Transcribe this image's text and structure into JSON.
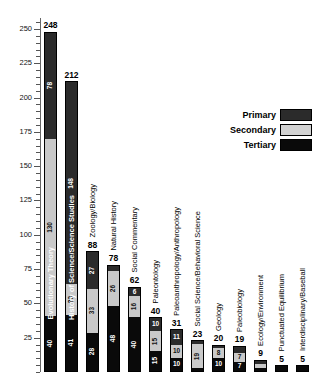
{
  "chart_data": {
    "type": "bar",
    "subtype": "stacked-vertical",
    "title": "",
    "xlabel": "",
    "ylabel": "",
    "ylim": [
      0,
      258
    ],
    "y_major_ticks": [
      25,
      50,
      75,
      100,
      125,
      150,
      175,
      200,
      225,
      250
    ],
    "y_tick_labels": [
      "25",
      "50",
      "75",
      "100",
      "125",
      "150",
      "175",
      "200",
      "225",
      "250"
    ],
    "y_minor_tick_step": 5,
    "grid": false,
    "legend_position": "upper-right",
    "categories": [
      "Evolutionary Theory",
      "History of Science/Science Studies",
      "Zoology/Biology",
      "Natural History",
      "Social Commentary",
      "Paleontology",
      "Paleoanthropology/Anthropology",
      "Social Science/Behavioral Science",
      "Geology",
      "Paleobiology",
      "Ecology/Environment",
      "Punctuated Equilibrium",
      "Interdisciplinary/Baseball"
    ],
    "series": [
      {
        "name": "Primary",
        "color": "#2b2b2b",
        "values": [
          78,
          148,
          27,
          4,
          6,
          10,
          11,
          2,
          2,
          5,
          3,
          0,
          0
        ]
      },
      {
        "name": "Secondary",
        "color": "#d2d2d2",
        "values": [
          130,
          23,
          33,
          26,
          16,
          15,
          10,
          19,
          8,
          7,
          3,
          0,
          0
        ]
      },
      {
        "name": "Tertiary",
        "color": "#0a0a0a",
        "values": [
          40,
          41,
          28,
          48,
          40,
          15,
          10,
          2,
          10,
          7,
          3,
          5,
          5
        ]
      }
    ],
    "totals": [
      248,
      212,
      88,
      78,
      62,
      40,
      31,
      23,
      20,
      19,
      9,
      5,
      5
    ]
  },
  "legend": {
    "title": "",
    "entries": [
      {
        "label": "Primary",
        "color": "#2b2b2b"
      },
      {
        "label": "Secondary",
        "color": "#d2d2d2"
      },
      {
        "label": "Tertiary",
        "color": "#0a0a0a"
      }
    ]
  },
  "bars": [
    {
      "category": "Evolutionary Theory",
      "total": "248",
      "label_placement": "inside",
      "segments": [
        {
          "tier": "primary",
          "value": "78",
          "class": "seg-tertiary"
        },
        {
          "tier": "secondary",
          "value": "130",
          "class": "seg-secondary"
        },
        {
          "tier": "tertiary",
          "value": "40",
          "class": "seg-primary"
        }
      ]
    },
    {
      "category": "History of Science/Science Studies",
      "total": "212",
      "label_placement": "inside",
      "segments": [
        {
          "tier": "primary",
          "value": "148",
          "class": "seg-tertiary"
        },
        {
          "tier": "secondary",
          "value": "23",
          "class": "seg-secondary"
        },
        {
          "tier": "tertiary",
          "value": "41",
          "class": "seg-primary"
        }
      ]
    },
    {
      "category": "Zoology/Biology",
      "total": "88",
      "label_placement": "outside",
      "segments": [
        {
          "tier": "primary",
          "value": "27",
          "class": "seg-tertiary"
        },
        {
          "tier": "secondary",
          "value": "33",
          "class": "seg-secondary"
        },
        {
          "tier": "tertiary",
          "value": "28",
          "class": "seg-primary"
        }
      ]
    },
    {
      "category": "Natural History",
      "total": "78",
      "label_placement": "outside",
      "segments": [
        {
          "tier": "primary",
          "value": "4",
          "class": "seg-tertiary"
        },
        {
          "tier": "secondary",
          "value": "26",
          "class": "seg-secondary"
        },
        {
          "tier": "tertiary",
          "value": "48",
          "class": "seg-primary"
        }
      ]
    },
    {
      "category": "Social Commentary",
      "total": "62",
      "label_placement": "outside",
      "segments": [
        {
          "tier": "primary",
          "value": "6",
          "class": "seg-tertiary"
        },
        {
          "tier": "secondary",
          "value": "16",
          "class": "seg-secondary"
        },
        {
          "tier": "tertiary",
          "value": "40",
          "class": "seg-primary"
        }
      ]
    },
    {
      "category": "Paleontology",
      "total": "40",
      "label_placement": "outside",
      "segments": [
        {
          "tier": "primary",
          "value": "10",
          "class": "seg-tertiary"
        },
        {
          "tier": "secondary",
          "value": "15",
          "class": "seg-secondary"
        },
        {
          "tier": "tertiary",
          "value": "15",
          "class": "seg-primary"
        }
      ]
    },
    {
      "category": "Paleoanthropology/Anthropology",
      "total": "31",
      "label_placement": "outside",
      "segments": [
        {
          "tier": "primary",
          "value": "11",
          "class": "seg-tertiary"
        },
        {
          "tier": "secondary",
          "value": "10",
          "class": "seg-secondary"
        },
        {
          "tier": "tertiary",
          "value": "10",
          "class": "seg-primary"
        }
      ]
    },
    {
      "category": "Social Science/Behavioral Science",
      "total": "23",
      "label_placement": "outside",
      "segments": [
        {
          "tier": "primary",
          "value": "2",
          "class": "seg-tertiary"
        },
        {
          "tier": "secondary",
          "value": "19",
          "class": "seg-secondary"
        },
        {
          "tier": "tertiary",
          "value": "2",
          "class": "seg-primary"
        }
      ]
    },
    {
      "category": "Geology",
      "total": "20",
      "label_placement": "outside",
      "segments": [
        {
          "tier": "primary",
          "value": "2",
          "class": "seg-tertiary"
        },
        {
          "tier": "secondary",
          "value": "8",
          "class": "seg-secondary"
        },
        {
          "tier": "tertiary",
          "value": "10",
          "class": "seg-primary"
        }
      ]
    },
    {
      "category": "Paleobiology",
      "total": "19",
      "label_placement": "outside",
      "segments": [
        {
          "tier": "primary",
          "value": "5",
          "class": "seg-tertiary"
        },
        {
          "tier": "secondary",
          "value": "7",
          "class": "seg-secondary"
        },
        {
          "tier": "tertiary",
          "value": "7",
          "class": "seg-primary"
        }
      ]
    },
    {
      "category": "Ecology/Environment",
      "total": "9",
      "label_placement": "outside",
      "segments": [
        {
          "tier": "primary",
          "value": "3",
          "class": "seg-tertiary"
        },
        {
          "tier": "secondary",
          "value": "3",
          "class": "seg-secondary"
        },
        {
          "tier": "tertiary",
          "value": "3",
          "class": "seg-primary"
        }
      ]
    },
    {
      "category": "Punctuated Equilibrium",
      "total": "5",
      "label_placement": "outside",
      "segments": [
        {
          "tier": "tertiary",
          "value": "5",
          "class": "seg-primary"
        }
      ]
    },
    {
      "category": "Interdisciplinary/Baseball",
      "total": "5",
      "label_placement": "outside",
      "segments": [
        {
          "tier": "tertiary",
          "value": "5",
          "class": "seg-primary"
        }
      ]
    }
  ]
}
